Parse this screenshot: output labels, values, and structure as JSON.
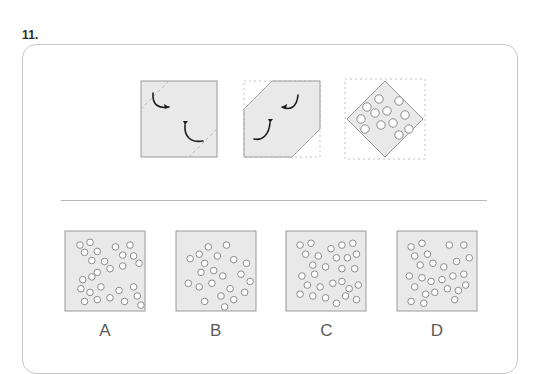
{
  "question": {
    "number_label": "11.",
    "type": "paper-folding-hole-punch"
  },
  "colors": {
    "paper_fill": "#e9e9e9",
    "paper_stroke": "#9a9a9a",
    "fold_dash": "#b5b5b5",
    "ghost_dash": "#c4c4c4",
    "arrow": "#1d1d1d",
    "hole_stroke": "#8c8c8c",
    "hole_fill": "#ffffff",
    "card_border": "#c9c9c9",
    "divider": "#b8b8b8",
    "label_text": "#5b5b5b",
    "number_text": "#2b2b2b",
    "page_background": "#ffffff"
  },
  "stimulus": {
    "panels": [
      {
        "id": "fold-step1",
        "name": "panel-fold-step1",
        "description": "Unfolded square sheet with two dashed diagonal fold lines near opposite corners and two curved fold arrows",
        "shape": "square",
        "fold_lines": 2,
        "arrows": 2,
        "holes": 0
      },
      {
        "id": "fold-step2",
        "name": "panel-fold-step2",
        "description": "Square with two opposite corners folded inward forming a hexagon, dashed ghost outline of original square, two curved fold arrows",
        "shape": "hexagon",
        "fold_lines": 2,
        "arrows": 2,
        "holes": 0
      },
      {
        "id": "punch-step3",
        "name": "panel-punch-step3",
        "description": "Folded sheet rotated to a diamond with twelve punched holes, dashed ghost outline of bounding square",
        "shape": "diamond",
        "fold_lines": 0,
        "arrows": 0,
        "holes": 12,
        "hole_positions": [
          [
            -18,
            -12
          ],
          [
            -6,
            -20
          ],
          [
            -24,
            0
          ],
          [
            -10,
            -6
          ],
          [
            2,
            -8
          ],
          [
            14,
            -18
          ],
          [
            -20,
            10
          ],
          [
            -4,
            6
          ],
          [
            8,
            4
          ],
          [
            20,
            -4
          ],
          [
            14,
            16
          ],
          [
            24,
            10
          ]
        ]
      }
    ]
  },
  "options": [
    {
      "label": "A",
      "name": "option-a",
      "hole_count": 27,
      "holes": [
        [
          11,
          10
        ],
        [
          22,
          7
        ],
        [
          16,
          18
        ],
        [
          30,
          17
        ],
        [
          24,
          27
        ],
        [
          38,
          28
        ],
        [
          50,
          12
        ],
        [
          58,
          21
        ],
        [
          66,
          10
        ],
        [
          70,
          22
        ],
        [
          76,
          30
        ],
        [
          44,
          36
        ],
        [
          58,
          33
        ],
        [
          30,
          40
        ],
        [
          14,
          48
        ],
        [
          24,
          45
        ],
        [
          12,
          58
        ],
        [
          22,
          62
        ],
        [
          34,
          56
        ],
        [
          30,
          70
        ],
        [
          44,
          68
        ],
        [
          16,
          72
        ],
        [
          54,
          60
        ],
        [
          60,
          72
        ],
        [
          70,
          56
        ],
        [
          74,
          66
        ],
        [
          78,
          76
        ]
      ]
    },
    {
      "label": "B",
      "name": "option-b",
      "hole_count": 22,
      "holes": [
        [
          20,
          20
        ],
        [
          30,
          12
        ],
        [
          10,
          25
        ],
        [
          26,
          30
        ],
        [
          40,
          22
        ],
        [
          50,
          10
        ],
        [
          36,
          38
        ],
        [
          58,
          26
        ],
        [
          72,
          30
        ],
        [
          22,
          40
        ],
        [
          46,
          44
        ],
        [
          66,
          42
        ],
        [
          8,
          52
        ],
        [
          20,
          56
        ],
        [
          34,
          52
        ],
        [
          54,
          58
        ],
        [
          44,
          66
        ],
        [
          58,
          70
        ],
        [
          70,
          62
        ],
        [
          26,
          72
        ],
        [
          48,
          78
        ],
        [
          76,
          50
        ]
      ]
    },
    {
      "label": "C",
      "name": "option-c",
      "hole_count": 28,
      "holes": [
        [
          10,
          10
        ],
        [
          22,
          8
        ],
        [
          16,
          20
        ],
        [
          30,
          22
        ],
        [
          24,
          32
        ],
        [
          44,
          14
        ],
        [
          56,
          10
        ],
        [
          68,
          8
        ],
        [
          50,
          24
        ],
        [
          62,
          24
        ],
        [
          72,
          20
        ],
        [
          38,
          34
        ],
        [
          56,
          36
        ],
        [
          70,
          36
        ],
        [
          12,
          44
        ],
        [
          26,
          42
        ],
        [
          18,
          54
        ],
        [
          32,
          56
        ],
        [
          10,
          64
        ],
        [
          24,
          66
        ],
        [
          38,
          68
        ],
        [
          46,
          52
        ],
        [
          56,
          50
        ],
        [
          64,
          58
        ],
        [
          74,
          54
        ],
        [
          60,
          66
        ],
        [
          72,
          70
        ],
        [
          50,
          74
        ]
      ]
    },
    {
      "label": "D",
      "name": "option-d",
      "hole_count": 26,
      "holes": [
        [
          10,
          12
        ],
        [
          22,
          8
        ],
        [
          14,
          22
        ],
        [
          28,
          20
        ],
        [
          20,
          32
        ],
        [
          34,
          30
        ],
        [
          52,
          10
        ],
        [
          68,
          10
        ],
        [
          74,
          24
        ],
        [
          46,
          34
        ],
        [
          60,
          28
        ],
        [
          8,
          44
        ],
        [
          22,
          46
        ],
        [
          14,
          56
        ],
        [
          32,
          50
        ],
        [
          44,
          48
        ],
        [
          56,
          44
        ],
        [
          68,
          42
        ],
        [
          50,
          58
        ],
        [
          62,
          60
        ],
        [
          70,
          54
        ],
        [
          26,
          64
        ],
        [
          36,
          62
        ],
        [
          10,
          72
        ],
        [
          24,
          74
        ],
        [
          58,
          70
        ]
      ]
    }
  ]
}
